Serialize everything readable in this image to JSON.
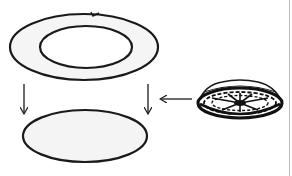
{
  "diagram": {
    "colors": {
      "stroke": "#1a1a1a",
      "fill_light": "#f4f4f4",
      "background": "#ffffff",
      "edge": "#bdbdbd"
    },
    "elements": [
      {
        "id": "ring-outer",
        "shape": "ellipse",
        "cx": 84,
        "cy": 47,
        "rx": 74,
        "ry": 33
      },
      {
        "id": "ring-inner",
        "shape": "ellipse",
        "cx": 86,
        "cy": 47,
        "rx": 46,
        "ry": 21
      },
      {
        "id": "arrow-left-down",
        "from": [
          24,
          83
        ],
        "to": [
          24,
          114
        ]
      },
      {
        "id": "arrow-right-down",
        "from": [
          148,
          83
        ],
        "to": [
          148,
          114
        ]
      },
      {
        "id": "bottom-disk",
        "shape": "ellipse",
        "cx": 85,
        "cy": 136,
        "rx": 62,
        "ry": 26
      },
      {
        "id": "arrow-left",
        "from": [
          191,
          99
        ],
        "to": [
          160,
          99
        ]
      },
      {
        "id": "dome-cap",
        "cx": 240,
        "cy": 100,
        "rx": 42,
        "ry": 18
      }
    ]
  }
}
